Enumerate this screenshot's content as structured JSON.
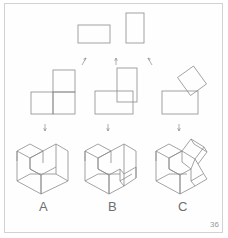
{
  "page": {
    "number": "36",
    "background_color": "#ffffff",
    "frame_color": "#d2d2d2",
    "line_color": "#8c8c8c",
    "label_color": "#6e6e6e"
  },
  "labels": {
    "a": "A",
    "b": "B",
    "c": "C"
  },
  "figures": [
    {
      "id": "A",
      "label": "A",
      "top_view": "horizontal-rectangle",
      "front_view": "l-shape-orthographic",
      "pictorial": "isometric-l-block"
    },
    {
      "id": "B",
      "label": "B",
      "top_view": "vertical-rectangle",
      "front_view": "overlapping-rectangles",
      "pictorial": "isometric-l-block-with-step"
    },
    {
      "id": "C",
      "label": "C",
      "top_view": "none",
      "front_view": "rotated-rectangle-over-rectangle",
      "pictorial": "isometric-angled-block"
    }
  ],
  "arrows": {
    "row1": [
      "arrow-up-left-icon",
      "arrow-up-icon",
      "arrow-up-right-icon"
    ],
    "row2": [
      "arrow-down-icon",
      "arrow-down-icon",
      "arrow-down-icon"
    ]
  }
}
